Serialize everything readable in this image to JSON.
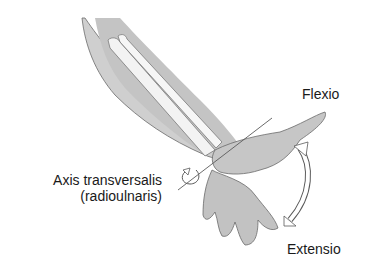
{
  "diagram": {
    "type": "anatomical-illustration",
    "labels": {
      "flexio": "Flexio",
      "axis_line1": "Axis transversalis",
      "axis_line2": "(radioulnaris)",
      "extensio": "Extensio"
    },
    "colors": {
      "skin": "#c8c8c8",
      "skin_shadow": "#a9a9a9",
      "bone": "#f2f2f2",
      "outline": "#5a5a5a",
      "text": "#1a1a1a"
    }
  }
}
